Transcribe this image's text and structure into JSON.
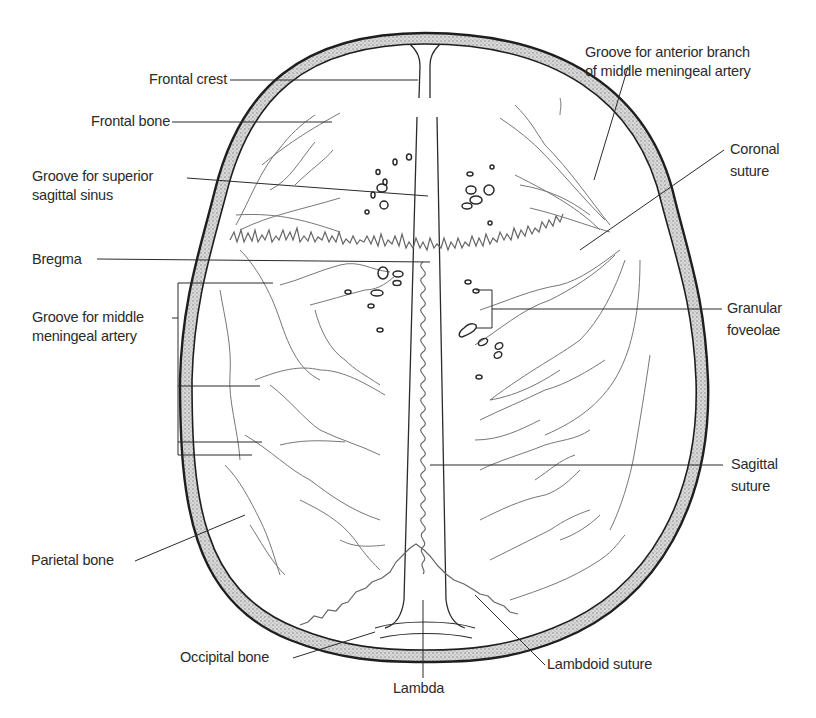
{
  "figure": {
    "colors": {
      "line": "#2b2b2b",
      "vessel": "#666666",
      "bone_fill": "#bdbdbd",
      "background": "#ffffff"
    }
  },
  "labels": {
    "frontal_crest": "Frontal crest",
    "frontal_bone": "Frontal bone",
    "groove_sss_1": "Groove for superior",
    "groove_sss_2": "sagittal sinus",
    "bregma": "Bregma",
    "groove_mma_1": "Groove for middle",
    "groove_mma_2": "meningeal artery",
    "parietal_bone": "Parietal bone",
    "occipital_bone": "Occipital bone",
    "lambda": "Lambda",
    "lambdoid_suture": "Lambdoid suture",
    "groove_ant_1": "Groove for anterior branch",
    "groove_ant_2": "of middle meningeal artery",
    "coronal_1": "Coronal",
    "coronal_2": "suture",
    "granular_1": "Granular",
    "granular_2": "foveolae",
    "sagittal_1": "Sagittal",
    "sagittal_2": "suture"
  }
}
